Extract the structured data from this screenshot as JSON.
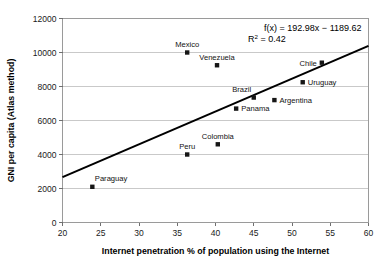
{
  "chart_data": {
    "type": "scatter",
    "title": "",
    "xlabel": "Internet penetration % of population using the Internet",
    "ylabel": "GNI per capita (Atlas method)",
    "xlim": [
      20,
      60
    ],
    "ylim": [
      0,
      12000
    ],
    "xticks": [
      "20",
      "25",
      "30",
      "35",
      "40",
      "45",
      "50",
      "55",
      "60"
    ],
    "yticks": [
      "0",
      "2000",
      "4000",
      "6000",
      "8000",
      "10000",
      "12000"
    ],
    "grid": "horizontal",
    "legend": "none",
    "marker_style": "filled-square-black",
    "annotations": {
      "equation": "f(x) = 192.98x − 1189.62",
      "r_squared_prefix": "R",
      "r_squared_exponent": "2",
      "r_squared_value": " = 0.42"
    },
    "trendline": {
      "slope": 192.98,
      "intercept": -1189.62,
      "x_start": 20,
      "y_start": 2670.0,
      "x_end": 60,
      "y_end": 10389.2
    },
    "points": [
      {
        "label": "Paraguay",
        "x": 23.9,
        "y": 2100,
        "label_pos": "above-right"
      },
      {
        "label": "Peru",
        "x": 36.3,
        "y": 4000,
        "label_pos": "above"
      },
      {
        "label": "Colombia",
        "x": 40.3,
        "y": 4600,
        "label_pos": "above"
      },
      {
        "label": "Panama",
        "x": 42.7,
        "y": 6700,
        "label_pos": "right"
      },
      {
        "label": "Argentina",
        "x": 47.7,
        "y": 7200,
        "label_pos": "right"
      },
      {
        "label": "Brazil",
        "x": 45.0,
        "y": 7350,
        "label_pos": "above-left"
      },
      {
        "label": "Uruguay",
        "x": 51.4,
        "y": 8250,
        "label_pos": "right"
      },
      {
        "label": "Venezuela",
        "x": 40.2,
        "y": 9250,
        "label_pos": "above"
      },
      {
        "label": "Chile",
        "x": 53.9,
        "y": 9400,
        "label_pos": "left"
      },
      {
        "label": "Mexico",
        "x": 36.3,
        "y": 10000,
        "label_pos": "above"
      }
    ],
    "colors": {
      "marker": "#161616",
      "trendline": "#000000",
      "gridline": "#c9c9c9",
      "frame": "#9a9a9a",
      "background": "#ffffff"
    }
  }
}
